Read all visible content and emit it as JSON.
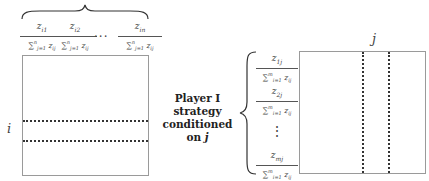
{
  "left_panel": {
    "column_fractions": [
      {
        "numerator": "z_i1",
        "denominator": "Σ_{j=1}^{n} z_ij"
      },
      {
        "numerator": "z_i2",
        "denominator": "Σ_{j=1}^{n} z_ij"
      },
      {
        "numerator": "z_in",
        "denominator": "Σ_{j=1}^{n} z_ij"
      }
    ],
    "ellipsis": "···",
    "row_label": "i"
  },
  "right_panel": {
    "column_label": "j",
    "group_label": {
      "line1": "Player I",
      "line2": "strategy",
      "line3": "conditioned",
      "line4_prefix": "on ",
      "line4_var": "j"
    },
    "row_fractions": [
      {
        "numerator": "z_1j",
        "denominator": "Σ_{i=1}^{m} z_ij"
      },
      {
        "numerator": "z_2j",
        "denominator": "Σ_{i=1}^{m} z_ij"
      },
      {
        "numerator": "z_mj",
        "denominator": "Σ_{i=1}^{m} z_ij"
      }
    ],
    "vertical_ellipsis": "⋮"
  },
  "display": {
    "left": {
      "frac1_num": "z",
      "frac1_sub": "i1",
      "frac2_num": "z",
      "frac2_sub": "i2",
      "frac3_num": "z",
      "frac3_sub": "in",
      "den_text": "∑",
      "den_sup": "n",
      "den_sub": "j=1",
      "den_var": "z",
      "den_var_sub": "ij"
    },
    "right": {
      "frac1_num": "z",
      "frac1_sub": "1j",
      "frac2_num": "z",
      "frac2_sub": "2j",
      "frac3_num": "z",
      "frac3_sub": "mj",
      "den_text": "∑",
      "den_sup": "m",
      "den_sub": "i=1",
      "den_var": "z",
      "den_var_sub": "ij"
    }
  }
}
